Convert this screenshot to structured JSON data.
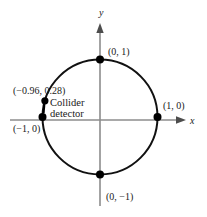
{
  "figure": {
    "colors": {
      "axis": "#8c8c8c",
      "circle": "#111111",
      "point": "#000000",
      "text": "#1a1a1a",
      "background": "#ffffff"
    },
    "axes": {
      "x_label": "x",
      "y_label": "y"
    },
    "circle": {
      "center_x": 0,
      "center_y": 0,
      "radius": 1
    },
    "points": [
      {
        "id": "top",
        "label": "(0, 1)",
        "x": 0,
        "y": 1
      },
      {
        "id": "right",
        "label": "(1, 0)",
        "x": 1,
        "y": 0
      },
      {
        "id": "bottom",
        "label": "(0, −1)",
        "x": 0,
        "y": -1
      },
      {
        "id": "left",
        "label": "(−1, 0)",
        "x": -1,
        "y": 0
      },
      {
        "id": "detector",
        "label": "(−0.96, 0.28)",
        "x": -0.96,
        "y": 0.28
      }
    ],
    "annotation": {
      "coord": "(−0.96, 0.28)",
      "line1": "Collider",
      "line2": "detector"
    }
  }
}
